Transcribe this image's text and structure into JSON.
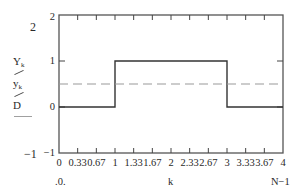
{
  "chart_data": {
    "type": "line",
    "title": "",
    "xlabel": "k",
    "ylabel": "",
    "xlim": [
      0,
      4
    ],
    "ylim": [
      -1,
      2
    ],
    "x_ticks": [
      "0",
      "0.33",
      "0.67",
      "1",
      "1.33",
      "1.67",
      "2",
      "2.33",
      "2.67",
      "3",
      "3.33",
      "3.67",
      "4"
    ],
    "y_ticks": [
      "-1",
      "0",
      "1",
      "2"
    ],
    "grid": false,
    "series": [
      {
        "name": "Y_k",
        "style": "solid-step",
        "color": "#333333",
        "x": [
          0,
          1,
          1,
          3,
          3,
          4
        ],
        "y": [
          0,
          0,
          1,
          1,
          0,
          0
        ]
      },
      {
        "name": "y_k",
        "style": "dashed",
        "color": "#999999",
        "x": [
          0,
          4
        ],
        "y": [
          0.5,
          0.5
        ]
      },
      {
        "name": "D",
        "style": "solid",
        "color": "#999999",
        "x": [],
        "y": []
      }
    ],
    "legend": {
      "position": "left",
      "entries": [
        "Y_k",
        "y_k",
        "D"
      ]
    },
    "axis_limit_labels": {
      "y_top": "2",
      "y_bottom": "-1",
      "x_left": ".0.",
      "x_right": "N-1"
    }
  },
  "labels": {
    "y_outer_top": "2",
    "y_outer_bottom": "−1",
    "x_left_limit": ".0.",
    "x_axis_name": "k",
    "x_right_limit": "N−1",
    "legend": [
      {
        "main": "Y",
        "sub": "k"
      },
      {
        "main": "y",
        "sub": "k"
      },
      {
        "main": "D",
        "sub": ""
      }
    ],
    "y_tick_labels": [
      {
        "value": 2,
        "text": "2"
      },
      {
        "value": 1,
        "text": "1"
      },
      {
        "value": 0,
        "text": "0"
      },
      {
        "value": -1,
        "text": "−1"
      }
    ],
    "x_tick_labels": [
      "0",
      "0.33",
      "0.67",
      "1",
      "1.33",
      "1.67",
      "2",
      "2.33",
      "2.67",
      "3",
      "3.33",
      "3.67",
      "4"
    ]
  },
  "colors": {
    "frame": "#555555",
    "trace_main": "#333333",
    "trace_dashed": "#9a9a9a",
    "legend_line": "#a0a0a0"
  }
}
